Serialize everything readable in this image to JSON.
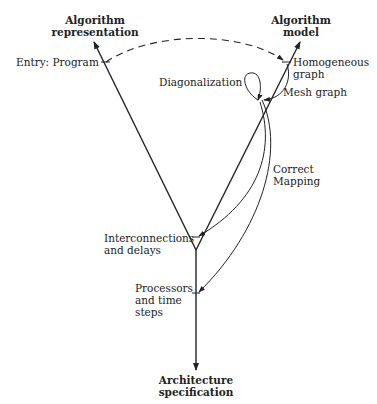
{
  "diagram": {
    "type": "Y-chart",
    "axes": {
      "left": {
        "line1": "Algorithm",
        "line2": "representation"
      },
      "right": {
        "line1": "Algorithm",
        "line2": "model"
      },
      "bottom": {
        "line1": "Architecture",
        "line2": "specification"
      }
    },
    "points": {
      "entry": "Entry: Program",
      "homogeneous": {
        "line1": "Homogeneous",
        "line2": "graph"
      },
      "mesh": "Mesh graph",
      "interconnections": {
        "line1": "Interconnections",
        "line2": "and delays"
      },
      "processors": {
        "line1": "Processors",
        "line2": "and time",
        "line3": "steps"
      }
    },
    "transformations": {
      "diagonalization": "Diagonalization",
      "correct_mapping": {
        "line1": "Correct",
        "line2": "Mapping"
      }
    },
    "colors": {
      "line": "#222222",
      "background": "#ffffff"
    }
  }
}
